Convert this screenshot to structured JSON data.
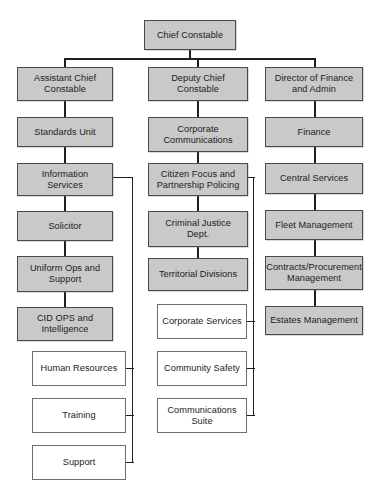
{
  "diagram": {
    "type": "organizational-chart",
    "background_color": "#ffffff",
    "filled_node_color": "#c9c9c9",
    "outline_node_color": "#ffffff",
    "border_color": "#4a4a4a",
    "connector_color": "#1f1f1f"
  },
  "nodes": {
    "root": {
      "label": "Chief Constable",
      "style": "filled"
    },
    "left_column": [
      {
        "label": "Assistant Chief\nConstable",
        "style": "filled"
      },
      {
        "label": "Standards Unit",
        "style": "filled"
      },
      {
        "label": "Information\nServices",
        "style": "filled"
      },
      {
        "label": "Solicitor",
        "style": "filled"
      },
      {
        "label": "Uniform Ops and\nSupport",
        "style": "filled"
      },
      {
        "label": "CID OPS and\nIntelligence",
        "style": "filled"
      }
    ],
    "left_branch": [
      {
        "label": "Human Resources",
        "style": "outline"
      },
      {
        "label": "Training",
        "style": "outline"
      },
      {
        "label": "Support",
        "style": "outline"
      }
    ],
    "middle_column": [
      {
        "label": "Deputy Chief\nConstable",
        "style": "filled"
      },
      {
        "label": "Corporate\nCommunications",
        "style": "filled"
      },
      {
        "label": "Citizen Focus and\nPartnership Policing",
        "style": "filled"
      },
      {
        "label": "Criminal Justice\nDept.",
        "style": "filled"
      },
      {
        "label": "Territorial Divisions",
        "style": "filled"
      }
    ],
    "middle_branch": [
      {
        "label": "Corporate Services",
        "style": "outline"
      },
      {
        "label": "Community Safety",
        "style": "outline"
      },
      {
        "label": "Communications\nSuite",
        "style": "outline"
      }
    ],
    "right_column": [
      {
        "label": "Director of Finance\nand Admin",
        "style": "filled"
      },
      {
        "label": "Finance",
        "style": "filled"
      },
      {
        "label": "Central Services",
        "style": "filled"
      },
      {
        "label": "Fleet Management",
        "style": "filled"
      },
      {
        "label": "Contracts/Procurement\nManagement",
        "style": "filled"
      },
      {
        "label": "Estates Management",
        "style": "filled"
      }
    ]
  }
}
